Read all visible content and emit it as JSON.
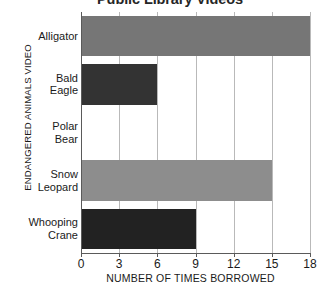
{
  "chart_data": {
    "type": "bar",
    "orientation": "horizontal",
    "title": "Public Library Videos",
    "xlabel": "NUMBER OF TIMES BORROWED",
    "ylabel": "ENDANGERED ANIMALS VIDEO",
    "categories": [
      "Alligator",
      "Bald Eagle",
      "Polar Bear",
      "Snow Leopard",
      "Whooping Crane"
    ],
    "category_lines": [
      [
        "Alligator"
      ],
      [
        "Bald",
        "Eagle"
      ],
      [
        "Polar",
        "Bear"
      ],
      [
        "Snow",
        "Leopard"
      ],
      [
        "Whooping",
        "Crane"
      ]
    ],
    "values": [
      18,
      6,
      0,
      15,
      9
    ],
    "bar_colors": [
      "#767676",
      "#333333",
      "#ffffff",
      "#8d8d8d",
      "#222222"
    ],
    "xlim": [
      0,
      18
    ],
    "xticks": [
      0,
      3,
      6,
      9,
      12,
      15,
      18
    ],
    "xtick_labels": [
      "0",
      "3",
      "6",
      "9",
      "12",
      "15",
      "18"
    ],
    "grid": "vertical",
    "legend": "none"
  }
}
